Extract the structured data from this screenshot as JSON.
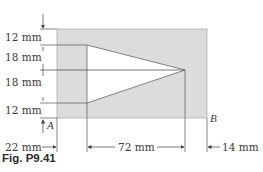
{
  "figure": {
    "caption": "Fig. P9.41",
    "colors": {
      "plate_fill": "#dcdcdc",
      "hole_fill": "#ffffff",
      "line": "#555555",
      "text": "#3a3a3a"
    },
    "vertical_dimensions": [
      {
        "label": "12 mm"
      },
      {
        "label": "18 mm"
      },
      {
        "label": "18 mm"
      },
      {
        "label": "12 mm"
      }
    ],
    "horizontal_dimensions": [
      {
        "label": "22 mm"
      },
      {
        "label": "72 mm"
      },
      {
        "label": "14 mm"
      }
    ],
    "axis_points": {
      "a": "A",
      "b": "B"
    }
  }
}
